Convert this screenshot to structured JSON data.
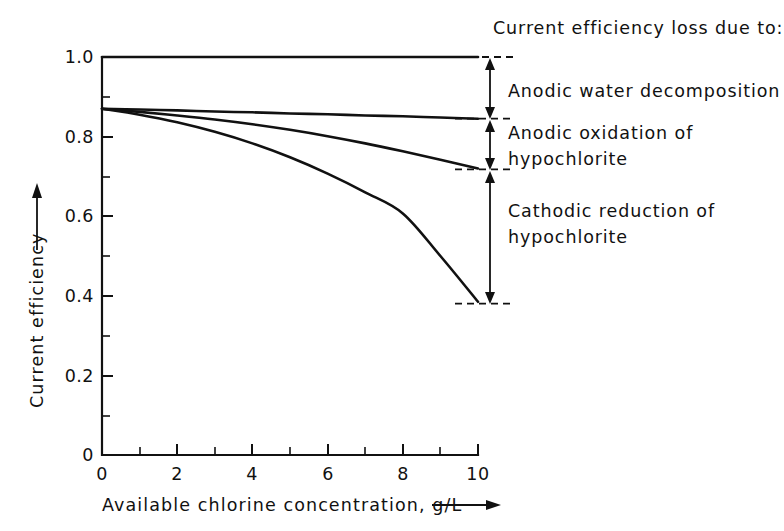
{
  "chart_data": {
    "type": "line",
    "title": "",
    "xlabel": "Available chlorine concentration, g/L",
    "ylabel": "Current efficiency",
    "xlim": [
      0,
      10
    ],
    "ylim": [
      0,
      1.0
    ],
    "grid": false,
    "legend_position": "right-annotations",
    "x_ticks_major": [
      "0",
      "2",
      "4",
      "6",
      "8",
      "10"
    ],
    "x_ticks_major_values": [
      0,
      2,
      4,
      6,
      8,
      10
    ],
    "x_ticks_minor_values": [
      1,
      3,
      5,
      7,
      9
    ],
    "y_ticks_major": [
      "0",
      "0.2",
      "0.4",
      "0.6",
      "0.8",
      "1.0"
    ],
    "y_ticks_major_values": [
      0,
      0.2,
      0.4,
      0.6,
      0.8,
      1.0
    ],
    "y_ticks_minor_values": [
      0.1,
      0.3,
      0.5,
      0.7,
      0.9
    ],
    "x": [
      0,
      1,
      2,
      3,
      4,
      5,
      6,
      7,
      8,
      9,
      10
    ],
    "series": [
      {
        "name": "Theoretical maximum efficiency",
        "values": [
          1.0,
          1.0,
          1.0,
          1.0,
          1.0,
          1.0,
          1.0,
          1.0,
          1.0,
          1.0,
          1.0
        ]
      },
      {
        "name": "After anodic water decomposition loss",
        "values": [
          0.87,
          0.868,
          0.866,
          0.863,
          0.861,
          0.858,
          0.856,
          0.853,
          0.851,
          0.848,
          0.845
        ]
      },
      {
        "name": "After anodic oxidation of hypochlorite loss",
        "values": [
          0.87,
          0.862,
          0.853,
          0.843,
          0.831,
          0.817,
          0.801,
          0.783,
          0.763,
          0.742,
          0.72
        ]
      },
      {
        "name": "After cathodic reduction of hypochlorite loss",
        "values": [
          0.87,
          0.855,
          0.836,
          0.812,
          0.783,
          0.748,
          0.707,
          0.66,
          0.607,
          0.5,
          0.385
        ]
      }
    ],
    "annotations": [
      {
        "label": "Anodic water decomposition",
        "from_value": 1.0,
        "to_value": 0.845
      },
      {
        "label": "Anodic oxidation of hypochlorite",
        "from_value": 0.845,
        "to_value": 0.72
      },
      {
        "label": "Cathodic reduction of hypochlorite",
        "from_value": 0.72,
        "to_value": 0.385
      }
    ]
  },
  "axes": {
    "y_label": "Current efficiency",
    "x_label": "Available chlorine concentration, g/L",
    "y_tick_1": "1.0",
    "y_tick_2": "0.8",
    "y_tick_3": "0.6",
    "y_tick_4": "0.4",
    "y_tick_5": "0.2",
    "y_tick_6": "0",
    "x_tick_1": "0",
    "x_tick_2": "2",
    "x_tick_3": "4",
    "x_tick_4": "6",
    "x_tick_5": "8",
    "x_tick_6": "10"
  },
  "annotations": {
    "heading": "Current efficiency loss due to:",
    "item_1_line_1": "Anodic water decomposition",
    "item_2_line_1": "Anodic oxidation of",
    "item_2_line_2": "hypochlorite",
    "item_3_line_1": "Cathodic reduction of",
    "item_3_line_2": "hypochlorite"
  },
  "colors": {
    "ink": "#111111",
    "background": "#ffffff"
  }
}
